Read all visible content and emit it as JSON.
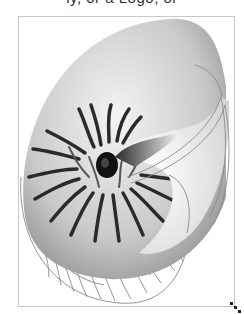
{
  "caption": {
    "text": "ly, or a Logo, or"
  },
  "image": {
    "subject": "nautilus-shell-illustration",
    "style": "grayscale shaded and outline line-art",
    "colors": {
      "border": "#c8c8c8",
      "shell_dark": "#2a2a2a",
      "shell_mid": "#8a8a8a",
      "shell_light": "#f2f2f2",
      "outline": "#777777"
    }
  },
  "resize_handle": {
    "icon": "resize-grip-icon"
  }
}
